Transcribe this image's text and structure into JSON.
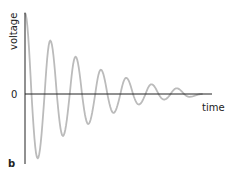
{
  "chart_data": {
    "type": "line",
    "title": "",
    "xlabel": "time",
    "ylabel": "voltage",
    "panel_label": "b",
    "y_tick_labels": [
      "0"
    ],
    "grid": false,
    "legend": "none",
    "series": [
      {
        "name": "voltage",
        "color": "#bbbbbb",
        "model": "damped-sine",
        "initial_amplitude": 1.0,
        "cycles": 7,
        "decay_per_cycle": 0.75,
        "x": [
          0,
          0.5,
          1.0,
          1.5,
          2.0,
          2.5,
          3.0,
          3.5,
          4.0,
          4.5,
          5.0,
          5.5,
          6.0,
          6.5,
          7.0
        ],
        "values": [
          1.0,
          -0.92,
          0.66,
          -0.6,
          0.46,
          -0.43,
          0.3,
          -0.27,
          0.2,
          -0.15,
          0.12,
          -0.08,
          0.07,
          -0.04,
          0.0
        ]
      }
    ],
    "axis_color": "#222222",
    "xlim": [
      0,
      7.5
    ],
    "ylim": [
      -1.0,
      1.0
    ]
  }
}
